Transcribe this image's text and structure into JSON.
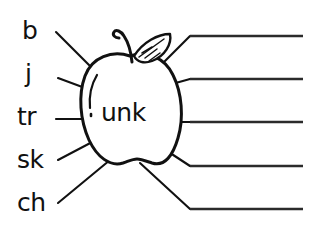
{
  "worksheet": {
    "type": "word-family-wheel",
    "background_color": "#ffffff",
    "ink_color": "#111111"
  },
  "apple": {
    "name": "apple-outline",
    "rime_text": "unk",
    "has_stem": true,
    "has_leaf": true,
    "has_highlight": true
  },
  "prefixes": [
    {
      "label": "b",
      "x": 22,
      "y": 18
    },
    {
      "label": "j",
      "x": 24,
      "y": 62
    },
    {
      "label": "tr",
      "x": 18,
      "y": 105
    },
    {
      "label": "sk",
      "x": 18,
      "y": 148
    },
    {
      "label": "ch",
      "x": 18,
      "y": 191
    }
  ],
  "answer_lines": [
    {
      "name": "answer-line-1",
      "value": ""
    },
    {
      "name": "answer-line-2",
      "value": ""
    },
    {
      "name": "answer-line-3",
      "value": ""
    },
    {
      "name": "answer-line-4",
      "value": ""
    },
    {
      "name": "answer-line-5",
      "value": ""
    }
  ],
  "connectors": {
    "left_count": 5,
    "right_count": 5
  }
}
